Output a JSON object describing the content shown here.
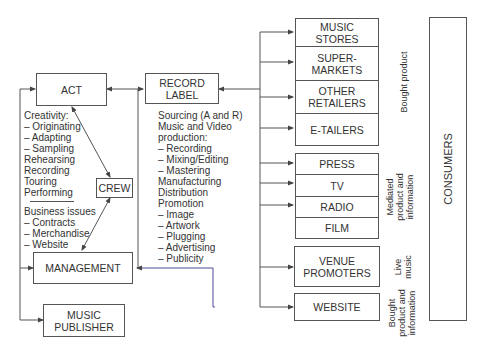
{
  "diagram": {
    "nodes": {
      "act": "ACT",
      "crew": "CREW",
      "record_label": "RECORD\nLABEL",
      "management": "MANAGEMENT",
      "music_publisher": "MUSIC\nPUBLISHER",
      "consumers": "CONSUMERS"
    },
    "act_activities": {
      "creativity": [
        "Creativity:",
        "– Originating",
        "– Adapting",
        "– Sampling",
        "Rehearsing",
        "Recording",
        "Touring",
        "Performing"
      ],
      "business": [
        "Business issues",
        "– Contracts",
        "– Merchandise",
        "– Website"
      ]
    },
    "label_activities": [
      "Sourcing (A and R)",
      "Music and Video",
      "production:",
      "– Recording",
      "– Mixing/Editing",
      "– Mastering",
      "Manufacturing",
      "Distribution",
      "Promotion",
      "– Image",
      "– Artwork",
      "– Plugging",
      "– Advertising",
      "– Publicity"
    ],
    "outlets": {
      "bought_product": [
        "MUSIC\nSTORES",
        "SUPER-\nMARKETS",
        "OTHER\nRETAILERS",
        "E-TAILERS"
      ],
      "mediated": [
        "PRESS",
        "TV",
        "RADIO",
        "FILM"
      ],
      "live": [
        "VENUE\nPROMOTERS"
      ],
      "bought_info": [
        "WEBSITE"
      ]
    },
    "group_labels": {
      "bought_product": "Bought product",
      "mediated": "Mediated\nproduct and\ninformation",
      "live": "Live\nmusic",
      "bought_info": "Bought\nproduct and\ninformation"
    },
    "colors": {
      "line": "#555555",
      "management_link": "#4a4a9a"
    }
  }
}
